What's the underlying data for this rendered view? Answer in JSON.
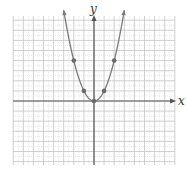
{
  "chart_data": {
    "type": "line",
    "title": "",
    "xlabel": "x",
    "ylabel": "y",
    "xlim": [
      -8,
      8
    ],
    "ylim": [
      -6.4,
      8.5
    ],
    "grid": true,
    "legend": null,
    "function": "y = x^2",
    "series": [
      {
        "name": "y = x^2",
        "curve_x_range": [
          -3,
          3
        ],
        "arrows_at_ends": true,
        "points": [
          {
            "x": -2,
            "y": 4
          },
          {
            "x": -1,
            "y": 1
          },
          {
            "x": 0,
            "y": 0
          },
          {
            "x": 1,
            "y": 1
          },
          {
            "x": 2,
            "y": 4
          }
        ]
      }
    ]
  },
  "labels": {
    "x_axis": "x",
    "y_axis": "y"
  },
  "colors": {
    "curve": "#7a7a7a",
    "points": "#6a6a6a",
    "axis": "#555555",
    "grid_minor": "#d8d8d8",
    "grid_major": "#c4c4c4"
  },
  "layout": {
    "origin_px": [
      94,
      101
    ],
    "unit_px": 10.1,
    "grid_left": 13,
    "grid_top": 16,
    "grid_right": 175,
    "grid_bottom": 165
  }
}
